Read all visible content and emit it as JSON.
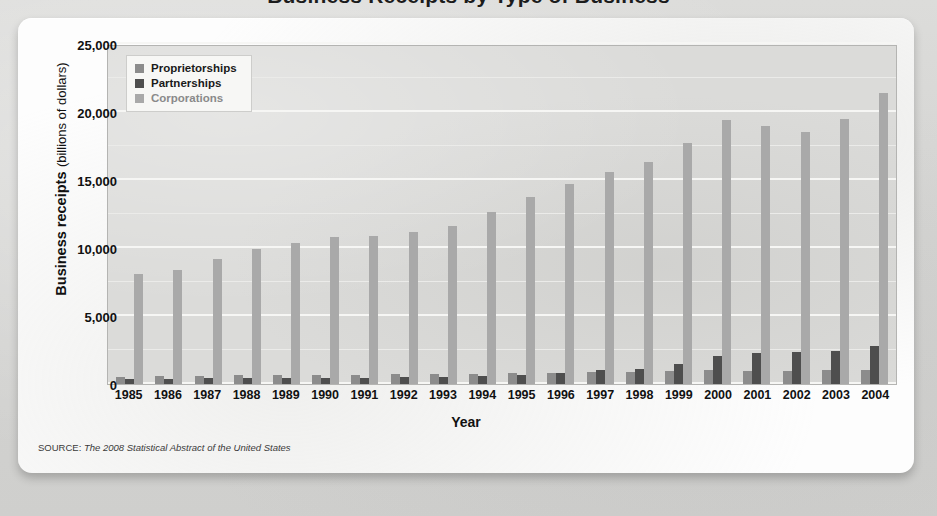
{
  "page": {
    "clipped_title": "Business Receipts by Type of Business"
  },
  "source_note": {
    "kicker": "SOURCE:",
    "title": "The 2008 Statistical Abstract of the United States"
  },
  "legend": {
    "items": [
      {
        "label": "Proprietorships",
        "swatch": "prop",
        "color": "#8c8c8c"
      },
      {
        "label": "Partnerships",
        "swatch": "part",
        "color": "#4e4e4e"
      },
      {
        "label": "Corporations",
        "swatch": "corp",
        "color": "#a9a9a9"
      }
    ]
  },
  "axis": {
    "y_title_strong": "Business receipts",
    "y_title_unit": "(billions of dollars)",
    "x_title": "Year",
    "y_ticks": [
      "0",
      "5,000",
      "10,000",
      "15,000",
      "20,000",
      "25,000"
    ]
  },
  "chart_data": {
    "type": "bar",
    "title": "Business Receipts by Type of Business",
    "xlabel": "Year",
    "ylabel": "Business receipts (billions of dollars)",
    "ylim": [
      0,
      25000
    ],
    "ytick_values": [
      0,
      5000,
      10000,
      15000,
      20000,
      25000
    ],
    "minor_gridline_interval": 2500,
    "grid": true,
    "legend_position": "top-left",
    "categories": [
      "1985",
      "1986",
      "1987",
      "1988",
      "1989",
      "1990",
      "1991",
      "1992",
      "1993",
      "1994",
      "1995",
      "1996",
      "1997",
      "1998",
      "1999",
      "2000",
      "2001",
      "2002",
      "2003",
      "2004"
    ],
    "series": [
      {
        "name": "Proprietorships",
        "color": "#8c8c8c",
        "values": [
          540,
          560,
          610,
          640,
          670,
          690,
          690,
          710,
          740,
          770,
          810,
          843,
          870,
          918,
          970,
          1020,
          990,
          990,
          1010,
          1050
        ]
      },
      {
        "name": "Partnerships",
        "color": "#4e4e4e",
        "values": [
          370,
          380,
          410,
          430,
          450,
          470,
          470,
          490,
          540,
          600,
          680,
          810,
          1000,
          1130,
          1450,
          2050,
          2250,
          2350,
          2450,
          2800
        ]
      },
      {
        "name": "Corporations",
        "color": "#a9a9a9",
        "values": [
          8100,
          8400,
          9200,
          9900,
          10400,
          10800,
          10850,
          11150,
          11650,
          12650,
          13750,
          14700,
          15600,
          16300,
          17700,
          19400,
          19000,
          18500,
          19500,
          21400
        ]
      }
    ]
  }
}
